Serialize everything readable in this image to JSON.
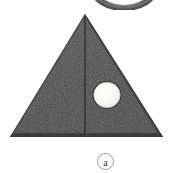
{
  "figure": {
    "background_color": "#ffffff",
    "width": 171,
    "height": 173,
    "caption": {
      "letter": "a",
      "circle_outline_color": "#9a9a9a",
      "text_color": "#33302e",
      "center_x": 105.5,
      "center_y": 161.5,
      "radius": 8.5
    },
    "shapes": {
      "triangle": {
        "name": "triangular-carbide-insert",
        "fill_color": "#4c4c4c",
        "edge_shadow_color": "#3b3b3b",
        "edge_highlight_color": "#6a6a6a",
        "apex_x": 85,
        "apex_y": 14,
        "base_left_x": 10,
        "base_right_x": 163,
        "base_y": 137
      },
      "center_line": {
        "name": "vertical-parting-line",
        "color": "#3a3a3a",
        "x": 85,
        "y_top": 17,
        "y_bottom": 136,
        "width": 1.6
      },
      "hole": {
        "name": "mounting-hole",
        "fill_color": "#f7f7f5",
        "rim_color": "#2f2f2f",
        "center_x": 107,
        "center_y": 95,
        "radius_x": 14,
        "radius_y": 13.5
      },
      "top_arc": {
        "name": "partial-ring-above",
        "stroke_color": "#4a4a4a",
        "center_x": 124,
        "center_y": -12,
        "outer_radius_x": 31,
        "outer_radius_y": 20,
        "inner_radius_x": 20,
        "inner_radius_y": 13
      }
    }
  }
}
